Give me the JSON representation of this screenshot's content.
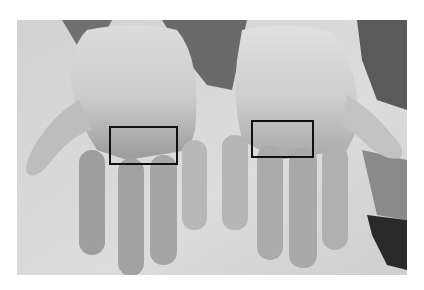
{
  "figure": {
    "background_color": "#ffffff",
    "photo_bounds": {
      "x": 17,
      "y": 20,
      "width": 390,
      "height": 255
    },
    "regions_of_interest": [
      {
        "label": "left-hand-roi",
        "x": 109,
        "y": 126,
        "width": 69,
        "height": 39,
        "color": "#111111"
      },
      {
        "label": "right-hand-roi",
        "x": 251,
        "y": 120,
        "width": 63,
        "height": 38,
        "color": "#111111"
      }
    ]
  }
}
